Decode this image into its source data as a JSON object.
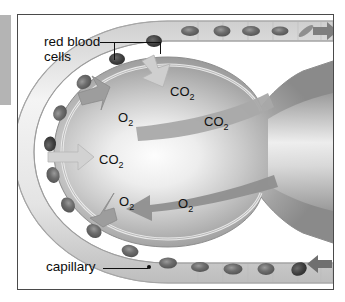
{
  "figure": {
    "type": "biological-diagram",
    "background_color": "#ffffff",
    "frame_border_color": "#4a4a4a",
    "edge_bar_color": "#b4b4b4"
  },
  "callouts": [
    {
      "id": "red-blood-cells",
      "line1": "red blood",
      "line2": "cells",
      "x": 26,
      "y": 20,
      "targets": [
        "upper-left red blood cell in capillary",
        "upper-right red blood cell in capillary"
      ]
    },
    {
      "id": "capillary",
      "line1": "capillary",
      "line2": "",
      "x": 28,
      "y": 252,
      "targets": [
        "capillary wall at lower left arc"
      ]
    }
  ],
  "gas_labels": [
    {
      "id": "co2-top",
      "formula": "CO",
      "subscript": "2",
      "x": 152,
      "y": 70,
      "meaning": "carbon dioxide diffusing into alveolus"
    },
    {
      "id": "o2-upper",
      "formula": "O",
      "subscript": "2",
      "x": 100,
      "y": 96,
      "meaning": "oxygen diffusing out of alveolus into blood"
    },
    {
      "id": "co2-right",
      "formula": "CO",
      "subscript": "2",
      "x": 186,
      "y": 100,
      "meaning": "carbon dioxide exhaled out through airway"
    },
    {
      "id": "co2-left",
      "formula": "CO",
      "subscript": "2",
      "x": 81,
      "y": 138,
      "meaning": "carbon dioxide entering alveolus from blood"
    },
    {
      "id": "o2-lower",
      "formula": "O",
      "subscript": "2",
      "x": 101,
      "y": 180,
      "meaning": "oxygen diffusing out of alveolus into blood"
    },
    {
      "id": "o2-airflow",
      "formula": "O",
      "subscript": "2",
      "x": 160,
      "y": 182,
      "meaning": "oxygen inhaled in through airway"
    }
  ],
  "structures": {
    "alveolus": "large rounded air sac with light center, narrowing at right into an airway duct",
    "capillary": "tube wrapping around the alveolus, entering bottom right and exiting top right",
    "red_blood_cells_count_visible": 18
  },
  "flow_arrows": [
    {
      "id": "blood-out-top",
      "direction": "right",
      "location": "top capillary right end",
      "color": "#7e7e7e"
    },
    {
      "id": "blood-in-bottom",
      "direction": "left",
      "location": "bottom capillary right end",
      "color": "#6f6f6f"
    },
    {
      "id": "co2-in-diffusion",
      "direction": "down-right",
      "location": "upper capillary wall",
      "color": "#c9c9c9"
    },
    {
      "id": "o2-out-upper",
      "direction": "up-left",
      "location": "upper-left wall",
      "color": "#9a9a9a"
    },
    {
      "id": "co2-in-left",
      "direction": "right",
      "location": "left wall",
      "color": "#cccccc"
    },
    {
      "id": "o2-out-lower",
      "direction": "down-left",
      "location": "lower-left wall",
      "color": "#9a9a9a"
    },
    {
      "id": "co2-exhale",
      "direction": "right",
      "location": "inside alveolus upper",
      "color": "#a8a8a8"
    },
    {
      "id": "o2-inhale",
      "direction": "left",
      "location": "inside alveolus lower",
      "color": "#8e8e8e"
    }
  ]
}
